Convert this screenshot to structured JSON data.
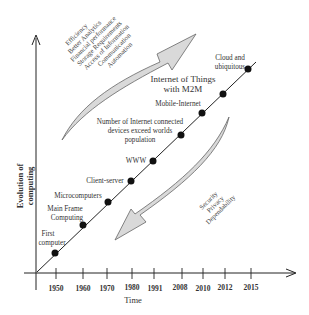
{
  "diagram": {
    "y_axis_label_line1": "Evolution of",
    "y_axis_label_line2": "computing",
    "x_axis_label": "Time",
    "x_ticks": [
      "1950",
      "1960",
      "1970",
      "1980",
      "1991",
      "2008",
      "2010",
      "2012",
      "2015"
    ],
    "milestones": [
      {
        "year": "1950",
        "label_line1": "First",
        "label_line2": "computer"
      },
      {
        "year": "1960",
        "label_line1": "Main Frame",
        "label_line2": "Computing"
      },
      {
        "year": "1970",
        "label_line1": "Microcomputers",
        "label_line2": ""
      },
      {
        "year": "1980",
        "label_line1": "Client-server",
        "label_line2": ""
      },
      {
        "year": "1991",
        "label_line1": "WWW",
        "label_line2": ""
      },
      {
        "year": "2008",
        "label_line1": "Number of Internet connected",
        "label_line2": "devices exceed worlds",
        "label_line3": "population"
      },
      {
        "year": "2010",
        "label_line1": "Mobile-Internet",
        "label_line2": ""
      },
      {
        "year": "2012",
        "label_line1": "Internet of Things",
        "label_line2": "with  M2M"
      },
      {
        "year": "2015",
        "label_line1": "Cloud and",
        "label_line2": "ubiquitous"
      }
    ],
    "benefits": [
      "Efficiency",
      "Better Analytics",
      "Financial performance",
      "Storage Requirements",
      "Access of Information",
      "Communication",
      "Automation"
    ],
    "challenges": [
      "Security",
      "Privacy",
      "Dependability"
    ],
    "colors": {
      "line": "#222222",
      "dot": "#111111",
      "arrow_fill": "#d9d9d9",
      "arrow_stroke": "#666666",
      "text": "#333333"
    }
  }
}
